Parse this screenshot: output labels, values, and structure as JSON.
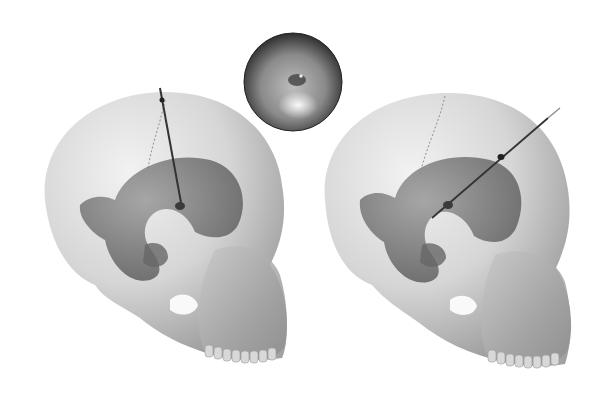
{
  "figure": {
    "panels": [
      {
        "name": "left-skull",
        "instrument": "vertical catheter through ventricle"
      },
      {
        "name": "endoscopic-view-inset",
        "shape": "circle"
      },
      {
        "name": "right-skull",
        "instrument": "oblique endoscope through ventricle"
      }
    ],
    "colors": {
      "background": "#ffffff",
      "skull_light": "#e6e6e6",
      "skull_dark": "#9a9a9a",
      "ventricle": "#7a7a7a",
      "instrument": "#333333",
      "inset_dark": "#3a3a3a",
      "inset_light": "#dcdcdc"
    }
  }
}
